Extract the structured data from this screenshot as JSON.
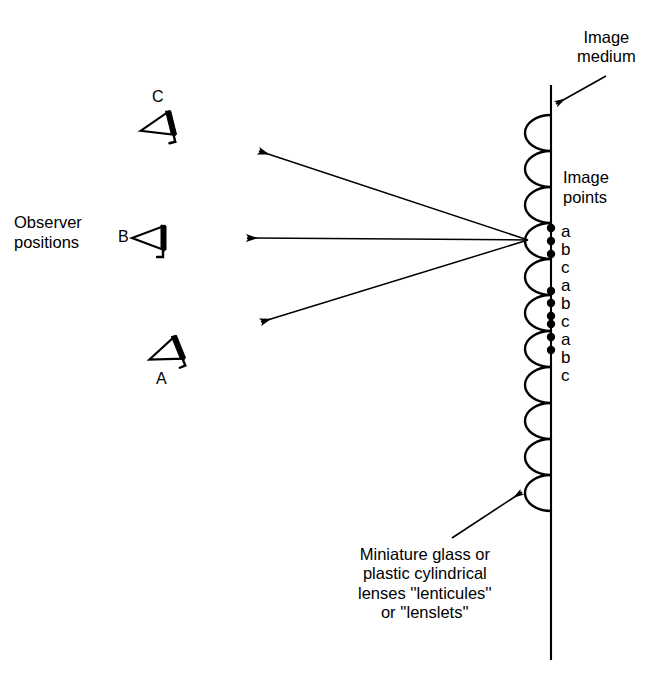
{
  "figure": {
    "type": "optical-ray-diagram",
    "background_color": "#ffffff",
    "ink_color": "#000000"
  },
  "labels": {
    "image_medium": "Image\nmedium",
    "image_points": "Image\npoints",
    "observer_positions": "Observer\npositions",
    "lenticule_caption": "Miniature glass or\nplastic cylindrical\nlenses ''lenticules''\nor ''lenslets''"
  },
  "observers": [
    {
      "id": "C",
      "label": "C",
      "label_position": "above",
      "x": 160,
      "y": 126,
      "label_x": 152,
      "label_y": 88,
      "rotation": -14
    },
    {
      "id": "B",
      "label": "B",
      "label_position": "left",
      "x": 152,
      "y": 238,
      "label_x": 118,
      "label_y": 228,
      "rotation": 0
    },
    {
      "id": "A",
      "label": "A",
      "label_position": "below",
      "x": 168,
      "y": 352,
      "label_x": 156,
      "label_y": 370,
      "rotation": -22
    }
  ],
  "rays": {
    "convergence_point": {
      "x": 528,
      "y": 240
    },
    "list": [
      {
        "to_observer": "C",
        "tip_x": 259,
        "tip_y": 151
      },
      {
        "to_observer": "B",
        "tip_x": 247,
        "tip_y": 238
      },
      {
        "to_observer": "A",
        "tip_x": 261,
        "tip_y": 322
      }
    ]
  },
  "image_medium_line": {
    "x": 551,
    "y_top": 85,
    "y_bottom": 660
  },
  "lenticules": {
    "count": 11,
    "pitch": 36,
    "bulge": 26,
    "y_start": 115,
    "x_base": 551
  },
  "image_points": {
    "letters": [
      "a",
      "b",
      "c",
      "a",
      "b",
      "c",
      "a",
      "b",
      "c"
    ],
    "dots": [
      {
        "letter": "a",
        "y": 228
      },
      {
        "letter": "b",
        "y": 241
      },
      {
        "letter": "c",
        "y": 254
      },
      {
        "letter": "a",
        "y": 291
      },
      {
        "letter": "b",
        "y": 303
      },
      {
        "letter": "c",
        "y": 316
      },
      {
        "letter": "a",
        "y": 324
      },
      {
        "letter": "b",
        "y": 337
      },
      {
        "letter": "c",
        "y": 350
      }
    ],
    "letter_x": 561,
    "dot_x": 551,
    "dot_radius": 4.2,
    "letter_rows_y": [
      222,
      240,
      258,
      276,
      294,
      312,
      330,
      348,
      366
    ]
  },
  "annotation_arrows": [
    {
      "name": "image-medium-arrow",
      "from_x": 606,
      "from_y": 76,
      "to_x": 556,
      "to_y": 104
    },
    {
      "name": "lenticule-arrow",
      "from_x": 452,
      "from_y": 538,
      "to_x": 522,
      "to_y": 492
    }
  ],
  "text_positions": {
    "image_medium": {
      "x": 577,
      "y": 28
    },
    "image_points": {
      "x": 563,
      "y": 168
    },
    "observer_positions": {
      "x": 14,
      "y": 213
    },
    "lenticule_caption": {
      "x": 358,
      "y": 545
    }
  }
}
